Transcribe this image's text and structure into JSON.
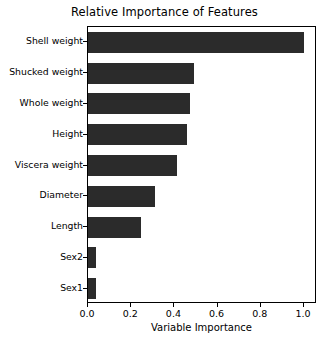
{
  "chart_data": {
    "type": "bar",
    "orientation": "horizontal",
    "title": "Relative Importance of Features",
    "xlabel": "Variable Importance",
    "ylabel": "",
    "categories": [
      "Sex1",
      "Sex2",
      "Length",
      "Diameter",
      "Viscera weight",
      "Height",
      "Whole weight",
      "Shucked weight",
      "Shell weight"
    ],
    "values": [
      0.035,
      0.035,
      0.245,
      0.31,
      0.41,
      0.46,
      0.47,
      0.49,
      1.0
    ],
    "categories_top_to_bottom": [
      "Shell weight",
      "Shucked weight",
      "Whole weight",
      "Height",
      "Viscera weight",
      "Diameter",
      "Length",
      "Sex2",
      "Sex1"
    ],
    "values_top_to_bottom": [
      1.0,
      0.49,
      0.47,
      0.46,
      0.41,
      0.31,
      0.245,
      0.035,
      0.035
    ],
    "xlim": [
      0.0,
      1.06
    ],
    "xticks": [
      0.0,
      0.2,
      0.4,
      0.6,
      0.8,
      1.0
    ],
    "xtick_labels": [
      "0.0",
      "0.2",
      "0.4",
      "0.6",
      "0.8",
      "1.0"
    ],
    "grid": false,
    "legend": null,
    "bar_color": "#2b2b2b",
    "background_color": "#ffffff",
    "axis_color": "#000000"
  }
}
